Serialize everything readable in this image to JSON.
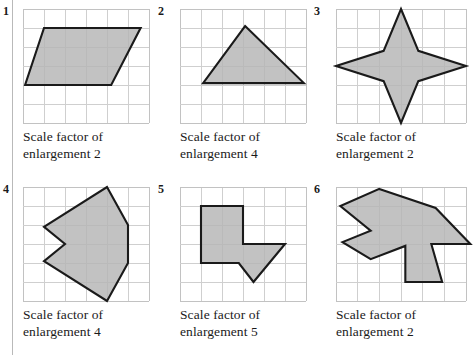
{
  "page": {
    "background": "#ffffff",
    "shape_fill": "#b4b4b4",
    "shape_stroke": "#1a1a1a",
    "grid_color": "#cfcfcf",
    "rule_color": "#b9b9b9"
  },
  "panels": [
    {
      "number": "1",
      "caption_line1": "Scale factor of",
      "caption_line2": "enlargement 2",
      "grid": {
        "cols": 6,
        "rows": 6
      },
      "shape_name": "parallelogram",
      "points": "1,1 5.6,1 4.2,4 0.1,4"
    },
    {
      "number": "2",
      "caption_line1": "Scale factor of",
      "caption_line2": "enlargement 4",
      "grid": {
        "cols": 6,
        "rows": 6
      },
      "shape_name": "triangle",
      "points": "3.1,0.9 5.9,3.9 1.1,3.9"
    },
    {
      "number": "3",
      "caption_line1": "Scale factor of",
      "caption_line2": "enlargement 2",
      "grid": {
        "cols": 6,
        "rows": 6
      },
      "shape_name": "four-pointed-star",
      "points": "3,0 3.8,2.2 6,3 3.8,3.8 3,6 2.2,3.8 0,3 2.2,2.2"
    },
    {
      "number": "4",
      "caption_line1": "Scale factor of",
      "caption_line2": "enlargement 4",
      "grid": {
        "cols": 6,
        "rows": 6
      },
      "shape_name": "concave-arrow-polygon",
      "points": "4,0 5,2 5,4 4,6 1,3.9 2,3 1,2.1"
    },
    {
      "number": "5",
      "caption_line1": "Scale factor of",
      "caption_line2": "enlargement 5",
      "grid": {
        "cols": 6,
        "rows": 6
      },
      "shape_name": "hooked-L-polygon",
      "points": "1,1 3,1 3,3 5,3 3.5,5 2.8,4 1,4"
    },
    {
      "number": "6",
      "caption_line1": "Scale factor of",
      "caption_line2": "enlargement 2",
      "grid": {
        "cols": 6,
        "rows": 6
      },
      "shape_name": "double-arrow-polygon",
      "points": "2,0.1 4.6,1.1 6.2,3 4.4,3 4.9,5 3.2,5 3.2,3.1 1.6,3.8 0.3,2.9 1.6,2.3 0.2,1"
    }
  ]
}
